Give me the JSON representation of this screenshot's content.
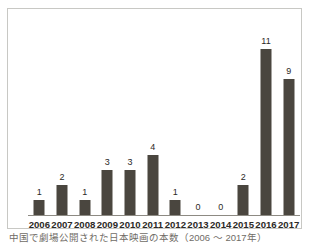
{
  "chart_data": {
    "type": "bar",
    "title": "",
    "subtitle": "",
    "caption": "中国で劇場公開された日本映画の本数（2006 ～ 2017年）",
    "xlabel": "",
    "ylabel": "",
    "categories": [
      "2006",
      "2007",
      "2008",
      "2009",
      "2010",
      "2011",
      "2012",
      "2013",
      "2014",
      "2015",
      "2016",
      "2017"
    ],
    "values": [
      1,
      2,
      1,
      3,
      3,
      4,
      1,
      0,
      0,
      2,
      11,
      9
    ],
    "value_labels": [
      "1",
      "2",
      "1",
      "3",
      "3",
      "4",
      "1",
      "0",
      "0",
      "2",
      "11",
      "9"
    ],
    "ylim": [
      0,
      13
    ],
    "grid": false,
    "legend": false,
    "legend_position": "none",
    "bar_color": "#4a463f",
    "axis_color": "#8d8a83",
    "frame_color": "#c8c8c4",
    "background_color": "#ffffff",
    "label_color": "#2b2926",
    "caption_color": "#6f6c66"
  }
}
